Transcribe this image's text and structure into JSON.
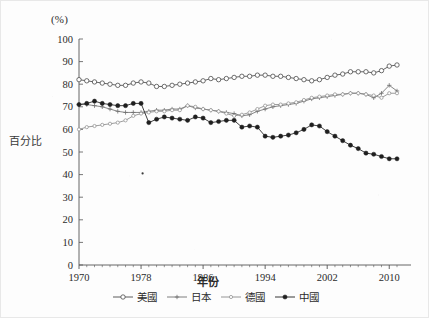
{
  "figure": {
    "unit_label": "(%)",
    "y_axis_title": "百分比",
    "x_axis_title": "年份"
  },
  "chart_data": {
    "type": "line",
    "title": "",
    "subtitle": "",
    "xlabel": "年份",
    "ylabel": "百分比",
    "unit_label": "(%)",
    "xlim": [
      1969,
      2012
    ],
    "ylim": [
      0,
      100
    ],
    "ytick_step": 10,
    "yticks": [
      0,
      10,
      20,
      30,
      40,
      50,
      60,
      70,
      80,
      90,
      100
    ],
    "xticks": [
      1970,
      1978,
      1986,
      1994,
      2002,
      2010
    ],
    "xtick_labels": [
      "1970",
      "1978",
      "1986",
      "1994",
      "2002",
      "2010"
    ],
    "ytick_labels": [
      "0",
      "10",
      "20",
      "30",
      "40",
      "50",
      "60",
      "70",
      "80",
      "90",
      "100"
    ],
    "grid": false,
    "legend_position": "bottom",
    "x": [
      1970,
      1971,
      1972,
      1973,
      1974,
      1975,
      1976,
      1977,
      1978,
      1979,
      1980,
      1981,
      1982,
      1983,
      1984,
      1985,
      1986,
      1987,
      1988,
      1989,
      1990,
      1991,
      1992,
      1993,
      1994,
      1995,
      1996,
      1997,
      1998,
      1999,
      2000,
      2001,
      2002,
      2003,
      2004,
      2005,
      2006,
      2007,
      2008,
      2009,
      2010,
      2011
    ],
    "series": [
      {
        "name": "美國",
        "color": "#4a4a4a",
        "marker": "open-circle",
        "values": [
          82,
          81.5,
          81,
          80.5,
          80,
          79.5,
          79.5,
          80.5,
          81,
          80.5,
          79,
          79,
          79.5,
          80,
          80.5,
          81,
          81.5,
          82.5,
          82,
          82.5,
          83,
          83.5,
          83.5,
          84,
          84,
          83.5,
          83.5,
          83,
          82.5,
          82,
          81.5,
          82,
          83,
          84,
          84.5,
          85.5,
          85.5,
          85.5,
          85,
          86,
          88,
          88.5
        ]
      },
      {
        "name": "日本",
        "color": "#707070",
        "marker": "plus",
        "values": [
          71,
          71,
          70.5,
          70,
          69,
          68,
          67.5,
          67.5,
          67.5,
          68,
          68.5,
          68.5,
          69,
          69,
          70.5,
          69.5,
          69,
          68.5,
          68,
          67.5,
          67,
          66,
          66.5,
          68,
          69,
          70,
          70.5,
          71,
          71.5,
          72.5,
          73.5,
          74,
          74.5,
          75,
          75.5,
          76,
          76,
          75.5,
          74,
          76,
          79.5,
          77
        ]
      },
      {
        "name": "德國",
        "color": "#8a8a8a",
        "marker": "small-open-circle",
        "values": [
          60,
          61,
          61.5,
          62,
          62.5,
          63,
          64,
          66,
          67,
          67.5,
          68,
          68,
          68.5,
          68.5,
          70.5,
          70,
          69,
          68.5,
          68,
          67,
          66,
          66.5,
          67.5,
          69,
          70.5,
          71,
          71,
          71.5,
          72,
          73,
          74,
          74.5,
          75,
          75.5,
          75.5,
          76,
          76,
          75.5,
          75,
          74,
          76,
          76
        ]
      },
      {
        "name": "中國",
        "color": "#1f1f1f",
        "marker": "filled-circle",
        "values": [
          71,
          71.5,
          72.5,
          71.5,
          71,
          70.5,
          70.5,
          71.5,
          71.5,
          63,
          64.5,
          65.5,
          65,
          64.5,
          64,
          65.5,
          65,
          63,
          63.5,
          64,
          64,
          61,
          61.5,
          61,
          57,
          56.5,
          57,
          57.5,
          58.5,
          60,
          62,
          61.5,
          59,
          57,
          55,
          53,
          51.5,
          49.5,
          49,
          48,
          47,
          47
        ]
      }
    ],
    "anomalies": [
      {
        "x": 1978.2,
        "y": 40.5,
        "note": "isolated scan speck"
      }
    ]
  },
  "legend": {
    "items": [
      {
        "label": "美國",
        "marker": "open-circle"
      },
      {
        "label": "日本",
        "marker": "plus"
      },
      {
        "label": "德國",
        "marker": "small-open-circle"
      },
      {
        "label": "中國",
        "marker": "filled-circle"
      }
    ]
  }
}
